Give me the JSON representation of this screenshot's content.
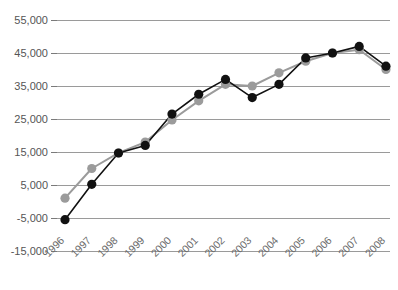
{
  "chart_data": {
    "type": "line",
    "title": "",
    "subtitle": "",
    "xlabel": "",
    "ylabel": "",
    "grid": true,
    "legend_position": "none",
    "categories": [
      "1996",
      "1997",
      "1998",
      "1999",
      "2000",
      "2001",
      "2002",
      "2003",
      "2004",
      "2005",
      "2006",
      "2007",
      "2008"
    ],
    "ylim": [
      -15000,
      55000
    ],
    "yticks": [
      -15000,
      -5000,
      5000,
      15000,
      25000,
      35000,
      45000,
      55000
    ],
    "ytick_labels": [
      "-15,000",
      "-5,000",
      "5,000",
      "15,000",
      "25,000",
      "35,000",
      "45,000",
      "55,000"
    ],
    "series": [
      {
        "name": "series-black",
        "color": "#111111",
        "marker": "circle",
        "values": [
          -5500,
          5200,
          14700,
          17000,
          26500,
          32500,
          37000,
          31500,
          35500,
          43500,
          45000,
          47000,
          41000
        ]
      },
      {
        "name": "series-gray",
        "color": "#9b9b9b",
        "marker": "circle",
        "values": [
          1000,
          10000,
          14700,
          18000,
          24700,
          30500,
          35500,
          35000,
          39000,
          42500,
          45000,
          46000,
          40000
        ]
      }
    ]
  },
  "colors": {
    "black_series": "#111111",
    "gray_series": "#9b9b9b",
    "gridline": "#9a9a9a",
    "axis_text": "#555555",
    "background": "#ffffff"
  }
}
